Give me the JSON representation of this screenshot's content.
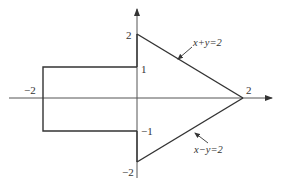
{
  "diagram": {
    "type": "region-plot",
    "colors": {
      "stroke": "#333333",
      "axis": "#555555",
      "background": "#ffffff"
    },
    "axes": {
      "x_axis": {
        "ticks": [
          "-2",
          "2"
        ]
      },
      "y_axis": {
        "ticks": [
          "2",
          "1",
          "-1",
          "-2"
        ]
      }
    },
    "labels": {
      "y_top": "2",
      "y_one": "1",
      "y_neg_one": "−1",
      "y_bottom": "−2",
      "x_left": "−2",
      "x_right": "2"
    },
    "annotations": {
      "upper_line": "x+y=2",
      "lower_line": "x−y=2"
    },
    "vertices": [
      {
        "x": -2,
        "y": 1
      },
      {
        "x": 0,
        "y": 1
      },
      {
        "x": 0,
        "y": 2
      },
      {
        "x": 2,
        "y": 0
      },
      {
        "x": 0,
        "y": -2
      },
      {
        "x": 0,
        "y": -1
      },
      {
        "x": -2,
        "y": -1
      }
    ]
  }
}
